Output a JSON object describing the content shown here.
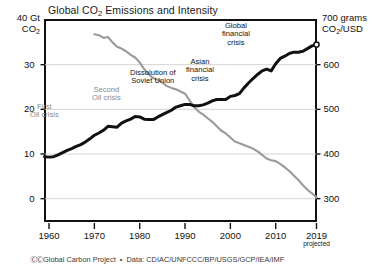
{
  "chart_data": {
    "type": "line",
    "title": "Global CO2 Emissions and Intensity",
    "title_main": "Global CO",
    "title_sub": "2",
    "title_rest": " Emissions and Intensity",
    "xlabel": "",
    "ylabel": "",
    "grid": true,
    "legend": "none",
    "xlim": [
      1959,
      2019
    ],
    "x_ticks": [
      "1960",
      "1970",
      "1980",
      "1990",
      "2000",
      "2010",
      "2019"
    ],
    "x_tick_values": [
      1960,
      1970,
      1980,
      1990,
      2000,
      2010,
      2019
    ],
    "x_last_note": "projected",
    "left_axis": {
      "unit_line1": "40 Gt",
      "unit_line2_pre": "CO",
      "unit_line2_sub": "2",
      "ticks": [
        "0",
        "10",
        "20",
        "30"
      ],
      "tick_values": [
        0,
        10,
        20,
        30
      ],
      "top_value": 40,
      "ylim": [
        -5,
        40
      ]
    },
    "right_axis": {
      "unit_line1": "700 grams",
      "unit_line2_pre": "CO",
      "unit_line2_sub": "2",
      "unit_line2_post": "/USD",
      "ticks": [
        "300",
        "400",
        "500",
        "600"
      ],
      "tick_values": [
        300,
        400,
        500,
        600
      ],
      "top_value": 700,
      "ylim": [
        250,
        700
      ]
    },
    "series": [
      {
        "name": "CO2 emissions",
        "axis": "left",
        "color": "#111111",
        "units": "Gt CO2",
        "end_marker": "open-circle",
        "x": [
          1959,
          1960,
          1961,
          1962,
          1963,
          1964,
          1965,
          1966,
          1967,
          1968,
          1969,
          1970,
          1971,
          1972,
          1973,
          1974,
          1975,
          1976,
          1977,
          1978,
          1979,
          1980,
          1981,
          1982,
          1983,
          1984,
          1985,
          1986,
          1987,
          1988,
          1989,
          1990,
          1991,
          1992,
          1993,
          1994,
          1995,
          1996,
          1997,
          1998,
          1999,
          2000,
          2001,
          2002,
          2003,
          2004,
          2005,
          2006,
          2007,
          2008,
          2009,
          2010,
          2011,
          2012,
          2013,
          2014,
          2015,
          2016,
          2017,
          2018,
          2019
        ],
        "values": [
          9.4,
          9.3,
          9.4,
          9.8,
          10.3,
          10.8,
          11.2,
          11.7,
          12.1,
          12.7,
          13.4,
          14.2,
          14.7,
          15.3,
          16.2,
          16.1,
          16.0,
          16.9,
          17.4,
          17.8,
          18.4,
          18.3,
          17.8,
          17.7,
          17.7,
          18.3,
          18.8,
          19.3,
          19.8,
          20.5,
          20.8,
          21.1,
          21.1,
          20.8,
          20.8,
          21.0,
          21.4,
          21.9,
          22.2,
          22.2,
          22.2,
          22.9,
          23.1,
          23.5,
          24.8,
          25.9,
          26.9,
          27.8,
          28.6,
          29.0,
          28.6,
          30.2,
          31.4,
          31.9,
          32.5,
          32.8,
          32.8,
          33.0,
          33.6,
          34.2,
          34.5
        ]
      },
      {
        "name": "CO2 intensity of GDP",
        "axis": "right",
        "color": "#9a9a9a",
        "units": "grams CO2 per USD",
        "x": [
          1970,
          1971,
          1972,
          1973,
          1974,
          1975,
          1976,
          1977,
          1978,
          1979,
          1980,
          1981,
          1982,
          1983,
          1984,
          1985,
          1986,
          1987,
          1988,
          1989,
          1990,
          1991,
          1992,
          1993,
          1994,
          1995,
          1996,
          1997,
          1998,
          1999,
          2000,
          2001,
          2002,
          2003,
          2004,
          2005,
          2006,
          2007,
          2008,
          2009,
          2010,
          2011,
          2012,
          2013,
          2014,
          2015,
          2016,
          2017,
          2018,
          2019
        ],
        "values": [
          668,
          666,
          660,
          662,
          650,
          640,
          636,
          630,
          622,
          616,
          605,
          590,
          578,
          570,
          566,
          560,
          552,
          548,
          545,
          540,
          535,
          520,
          505,
          495,
          488,
          480,
          472,
          462,
          452,
          446,
          437,
          428,
          424,
          420,
          416,
          412,
          406,
          398,
          390,
          386,
          384,
          378,
          370,
          362,
          352,
          342,
          330,
          320,
          312,
          303
        ]
      }
    ],
    "annotations": [
      {
        "text_lines": [
          "First",
          "Oil crisis"
        ],
        "style": "gray",
        "x": 1973,
        "note": "First Oil crisis"
      },
      {
        "text_lines": [
          "Second",
          "Oil crisis"
        ],
        "style": "gray",
        "x": 1979,
        "note": "Second Oil crisis"
      },
      {
        "text_lines": [
          "Dissolution of",
          "Soviet Union"
        ],
        "style": "dark",
        "x": 1991,
        "note": "Dissolution of Soviet Union"
      },
      {
        "text_lines": [
          "Asian",
          "financial",
          "crisis"
        ],
        "style": "dark",
        "x": 1998,
        "note": "Asian financial crisis"
      },
      {
        "text_lines": [
          "Global",
          "financial",
          "crisis"
        ],
        "style": "dark",
        "x": 2009,
        "note": "Global financial crisis"
      }
    ]
  },
  "footer": {
    "cc_badges": "ⒸⒸ",
    "credit": "Global Carbon Project",
    "separator": "•",
    "data_sources": "Data: CDIAC/UNFCCC/BP/USGS/GCP/IEA/IMF"
  }
}
